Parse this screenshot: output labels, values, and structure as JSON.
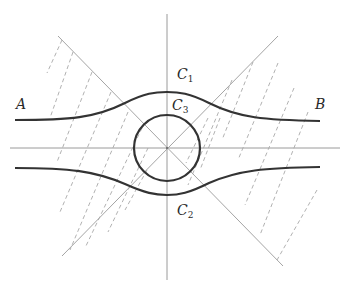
{
  "diagram": {
    "type": "geometric-figure",
    "labels": {
      "a": {
        "text": "A",
        "x": 16,
        "y": 97
      },
      "b": {
        "text": "B",
        "x": 315,
        "y": 97
      },
      "c1": {
        "main": "C",
        "sub": "1",
        "x": 177,
        "y": 67
      },
      "c3": {
        "main": "C",
        "sub": "3",
        "x": 172,
        "y": 98
      },
      "c2": {
        "main": "C",
        "sub": "2",
        "x": 177,
        "y": 203
      }
    },
    "colors": {
      "axis": "#9a9a9a",
      "diagonal": "#9a9a9a",
      "dashed": "#a8a8a8",
      "curve": "#333333"
    },
    "center": {
      "x": 167,
      "y": 148
    },
    "circle_radius": 33,
    "elements": [
      "horizontal-axis",
      "vertical-axis",
      "diagonal-nw-se",
      "diagonal-ne-sw",
      "circle-C3",
      "curve-C1",
      "curve-C2",
      "dashed-hatching-left",
      "dashed-hatching-right"
    ]
  }
}
